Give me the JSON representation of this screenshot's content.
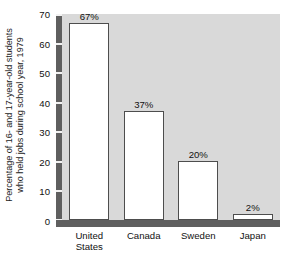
{
  "chart_data": {
    "type": "bar",
    "title": "",
    "subtitle": "",
    "xlabel": "",
    "ylabel_lines": [
      "Percentage of 16- and 17-year-old students",
      "who held jobs during school year, 1979"
    ],
    "ylabel": "Percentage of 16- and 17-year-old students who held jobs during school year, 1979",
    "categories": [
      "United States",
      "Canada",
      "Sweden",
      "Japan"
    ],
    "category_lines": [
      [
        "United",
        "States"
      ],
      [
        "Canada"
      ],
      [
        "Sweden"
      ],
      [
        "Japan"
      ]
    ],
    "values": [
      67,
      37,
      20,
      2
    ],
    "value_labels": [
      "67%",
      "37%",
      "20%",
      "2%"
    ],
    "ylim": [
      0,
      70
    ],
    "yticks": [
      0,
      10,
      20,
      30,
      40,
      50,
      60,
      70
    ],
    "ytick_labels": [
      "0",
      "10",
      "20",
      "30",
      "40",
      "50",
      "60",
      "70"
    ],
    "grid": false,
    "legend": null,
    "colors": {
      "bar_fill": "#ffffff",
      "bar_border": "#4d4d4d",
      "plot_background": "#d9d9d9",
      "axis_rail": "#5f5f5f",
      "tick_mark": "#f2f2f2",
      "text": "#111111",
      "page_background": "#ffffff"
    }
  }
}
